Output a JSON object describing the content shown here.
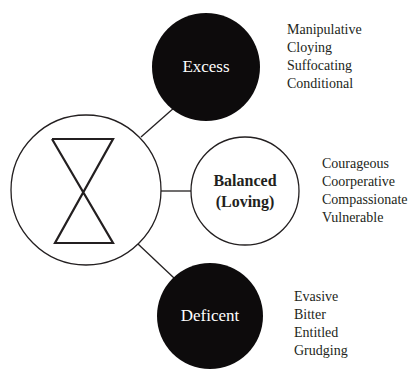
{
  "colors": {
    "background": "#ffffff",
    "stroke": "#231f20",
    "filled_circle": "#0d0b0c",
    "text_on_dark": "#ffffff",
    "text": "#231f20"
  },
  "diagram": {
    "central_node": {
      "icon": "hourglass-icon"
    },
    "nodes": [
      {
        "id": "excess",
        "label": "Excess",
        "style": "filled",
        "traits": [
          "Manipulative",
          "Cloying",
          "Suffocating",
          "Conditional"
        ]
      },
      {
        "id": "balanced",
        "label_line1": "Balanced",
        "label_line2": "(Loving)",
        "style": "outline",
        "traits": [
          "Courageous",
          "Coorperative",
          "Compassionate",
          "Vulnerable"
        ]
      },
      {
        "id": "deficent",
        "label": "Deficent",
        "style": "filled",
        "traits": [
          "Evasive",
          "Bitter",
          "Entitled",
          "Grudging"
        ]
      }
    ]
  }
}
